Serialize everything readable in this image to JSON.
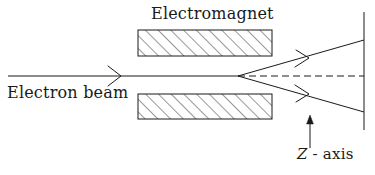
{
  "figure": {
    "kind": "schematic-diagram",
    "width": 375,
    "height": 175,
    "background_color": "#ffffff",
    "ink_color": "#1a1a1a"
  },
  "labels": {
    "electromagnet": "Electromagnet",
    "electron_beam": "Electron beam",
    "z_axis_symbol": "Z",
    "z_axis_rest": " - axis",
    "z_axis_full": "Z - axis"
  },
  "geometry": {
    "beam_axis_y": 76,
    "beam_line": {
      "x1": 8,
      "y1": 76,
      "x2": 238,
      "y2": 76
    },
    "beam_arrow_tip_x": 120,
    "cone_apex": {
      "x": 238,
      "y": 76
    },
    "cone_upper_end": {
      "x": 364,
      "y": 40
    },
    "cone_lower_end": {
      "x": 364,
      "y": 112
    },
    "dashed_axis": {
      "x1": 238,
      "y1": 76,
      "x2": 364,
      "y2": 76
    },
    "screen_line": {
      "x": 364,
      "y1": 12,
      "y2": 130
    },
    "z_arrow": {
      "x": 310,
      "y_tail": 148,
      "y_tip": 118
    },
    "pole_upper": {
      "x": 138,
      "y": 30,
      "width": 134,
      "height": 26
    },
    "pole_lower": {
      "x": 138,
      "y": 94,
      "width": 134,
      "height": 25
    },
    "hatch_angle_deg": 45,
    "hatch_spacing_px": 9
  }
}
